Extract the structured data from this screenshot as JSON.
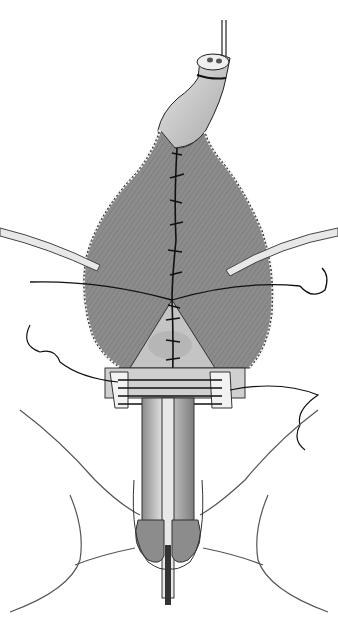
{
  "figure": {
    "type": "surgical-illustration",
    "style": "grayscale line-and-tone drawing",
    "labels": [],
    "colors": {
      "background": "#ffffff",
      "flap_tone": "#8e8e8e",
      "flap_shadow": "#6f6f6f",
      "tissue_light": "#d6d6d6",
      "tissue_mid": "#b8b8b8",
      "outline": "#1a1a1a",
      "edge_dots": "#e8e8e8"
    }
  }
}
